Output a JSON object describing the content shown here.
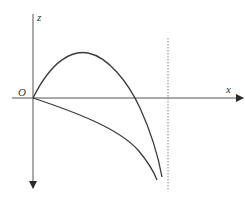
{
  "diagram": {
    "labels": {
      "z_axis": "z",
      "x_axis": "x",
      "origin": "O"
    },
    "colors": {
      "line": "#3a3a3a",
      "dotted": "#888888",
      "background": "#ffffff"
    },
    "elements": {
      "z_axis": {
        "x": 33,
        "y_top": 14,
        "y_bottom": 188,
        "arrow": "down"
      },
      "x_axis": {
        "y": 98,
        "x_left": 12,
        "x_right": 243,
        "arrow": "right"
      },
      "upper_curve": {
        "start": [
          33,
          98
        ],
        "peak": [
          85,
          53
        ],
        "x_crossing": [
          134,
          98
        ],
        "end": [
          162,
          177
        ]
      },
      "lower_curve": {
        "start": [
          33,
          98
        ],
        "end": [
          157,
          180
        ]
      },
      "dotted_line": {
        "x": 168,
        "y_top": 38,
        "y_bottom": 190
      }
    }
  }
}
